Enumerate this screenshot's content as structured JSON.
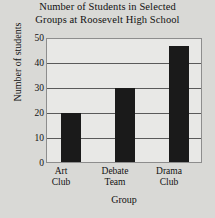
{
  "chart_data": {
    "type": "bar",
    "title": "Number of Students in Selected Groups at Roosevelt High School",
    "title_lines": [
      "Number of Students in Selected",
      "Groups at Roosevelt High School"
    ],
    "categories": [
      "Art Club",
      "Debate Team",
      "Drama Club"
    ],
    "category_lines": [
      [
        "Art",
        "Club"
      ],
      [
        "Debate",
        "Team"
      ],
      [
        "Drama",
        "Club"
      ]
    ],
    "values": [
      20,
      30,
      47
    ],
    "xlabel": "Group",
    "ylabel": "Number of students",
    "ylim": [
      0,
      50
    ],
    "yticks": [
      50,
      40,
      30,
      20,
      10,
      0
    ],
    "ytick_labels": [
      "50",
      "40",
      "30",
      "20",
      "10",
      "0"
    ],
    "grid": true,
    "legend": false,
    "colors": {
      "bar": "#1a1a1a",
      "plot_background": "#e8e8e6",
      "page_background": "#d9d9d6",
      "gridline": "#5a5a5a",
      "frame": "#8d8d8d",
      "text": "#111111"
    }
  }
}
